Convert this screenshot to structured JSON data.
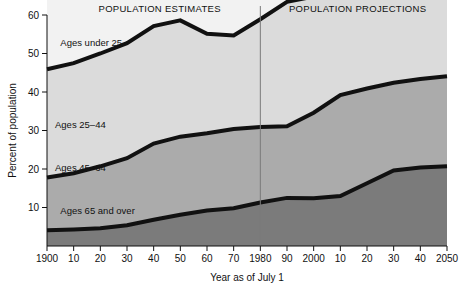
{
  "chart_data": {
    "type": "area",
    "title": "",
    "subtitle": "",
    "xlabel": "Year as of July 1",
    "ylabel": "Percent of population",
    "xlim": [
      1900,
      2050
    ],
    "ylim": [
      0,
      60
    ],
    "grid": false,
    "legend_position": "inline-band-labels",
    "stacked": true,
    "stack_order_bottom_to_top": [
      "Ages 65 and over",
      "Ages 45–64",
      "Ages 25–44",
      "Ages under 25"
    ],
    "x": [
      1900,
      1910,
      1920,
      1930,
      1940,
      1950,
      1960,
      1970,
      1980,
      1990,
      2000,
      2010,
      2020,
      2030,
      2040,
      2050
    ],
    "x_tick_labels": [
      "1900",
      "10",
      "20",
      "30",
      "40",
      "50",
      "60",
      "70",
      "1980",
      "90",
      "2000",
      "10",
      "20",
      "30",
      "40",
      "2050"
    ],
    "y_tick_labels": [
      "10",
      "20",
      "30",
      "40",
      "50",
      "60"
    ],
    "y_ticks": [
      10,
      20,
      30,
      40,
      50,
      60
    ],
    "series": [
      {
        "name": "Ages 65 and over",
        "label": "Ages 65 and over",
        "color": "#7b7b7b",
        "values": [
          4.1,
          4.3,
          4.6,
          5.4,
          6.8,
          8.1,
          9.2,
          9.8,
          11.3,
          12.5,
          12.4,
          13.0,
          16.3,
          19.6,
          20.4,
          20.7
        ]
      },
      {
        "name": "Ages 45–64",
        "label": "Ages 45–64",
        "color": "#ababab",
        "values": [
          13.7,
          14.6,
          16.1,
          17.4,
          19.8,
          20.3,
          20.1,
          20.6,
          19.6,
          18.6,
          22.2,
          26.2,
          24.6,
          22.8,
          23.0,
          23.4
        ]
      },
      {
        "name": "Ages 25–44",
        "label": "Ages 25–44",
        "color": "#dbdbdb",
        "values": [
          28.1,
          28.6,
          29.3,
          29.9,
          30.5,
          30.2,
          25.8,
          24.3,
          28.0,
          32.3,
          30.2,
          26.8,
          26.5,
          26.0,
          26.5,
          26.8
        ]
      },
      {
        "name": "Ages under 25",
        "label": "Ages under 25",
        "color": "#f2f2f2",
        "values": [
          54.1,
          52.5,
          50.0,
          47.3,
          42.9,
          41.4,
          44.9,
          45.3,
          41.1,
          36.6,
          35.2,
          34.0,
          32.6,
          31.7,
          30.1,
          29.1
        ]
      }
    ],
    "annotations": [
      {
        "name": "estimates-header",
        "text": "POPULATION ESTIMATES",
        "x_center": 1935
      },
      {
        "name": "projections-header",
        "text": "POPULATION PROJECTIONS",
        "x_center": 2015
      },
      {
        "name": "divider",
        "text": "",
        "x": 1980
      }
    ]
  },
  "headers": {
    "estimates": "POPULATION ESTIMATES",
    "projections": "POPULATION PROJECTIONS"
  },
  "axes": {
    "y_label": "Percent of population",
    "x_label": "Year as of July 1"
  },
  "band_labels": {
    "under25": "Ages under 25",
    "a2544": "Ages 25–44",
    "a4564": "Ages 45–64",
    "a65plus": "Ages 65 and over"
  },
  "colors": {
    "under25": "#f2f2f2",
    "a2544": "#dbdbdb",
    "a4564": "#ababab",
    "a65plus": "#7b7b7b",
    "outline": "#111111",
    "divider": "#7a7a7a",
    "axis": "#111111"
  }
}
